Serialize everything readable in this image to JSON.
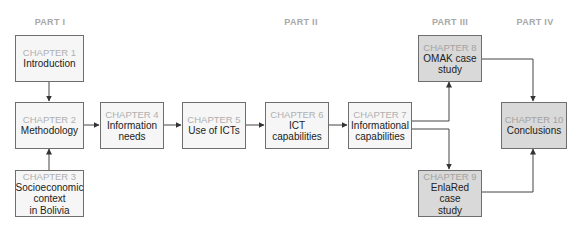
{
  "parts": [
    {
      "label": "PART I",
      "x": 50
    },
    {
      "label": "PART II",
      "x": 301
    },
    {
      "label": "PART III",
      "x": 450
    },
    {
      "label": "PART IV",
      "x": 535
    }
  ],
  "chapters": [
    {
      "id": "ch1",
      "chapter": "CHAPTER 1",
      "title_lines": [
        "Introduction"
      ],
      "part": "PART I",
      "shaded": false
    },
    {
      "id": "ch2",
      "chapter": "CHAPTER 2",
      "title_lines": [
        "Methodology"
      ],
      "part": "PART I",
      "shaded": false
    },
    {
      "id": "ch3",
      "chapter": "CHAPTER 3",
      "title_lines": [
        "Socioeconomic",
        "context",
        "in Bolivia"
      ],
      "part": "PART I",
      "shaded": false
    },
    {
      "id": "ch4",
      "chapter": "CHAPTER 4",
      "title_lines": [
        "Information",
        "needs"
      ],
      "part": "PART II",
      "shaded": false
    },
    {
      "id": "ch5",
      "chapter": "CHAPTER 5",
      "title_lines": [
        "Use of ICTs"
      ],
      "part": "PART II",
      "shaded": false
    },
    {
      "id": "ch6",
      "chapter": "CHAPTER 6",
      "title_lines": [
        "ICT",
        "capabilities"
      ],
      "part": "PART II",
      "shaded": false
    },
    {
      "id": "ch7",
      "chapter": "CHAPTER 7",
      "title_lines": [
        "Informational",
        "capabilities"
      ],
      "part": "PART II",
      "shaded": false
    },
    {
      "id": "ch8",
      "chapter": "CHAPTER 8",
      "title_lines": [
        "OMAK case",
        "study"
      ],
      "part": "PART III",
      "shaded": true
    },
    {
      "id": "ch9",
      "chapter": "CHAPTER 9",
      "title_lines": [
        "EnlaRed case",
        "study"
      ],
      "part": "PART III",
      "shaded": true
    },
    {
      "id": "ch10",
      "chapter": "CHAPTER 10",
      "title_lines": [
        "Conclusions"
      ],
      "part": "PART IV",
      "shaded": true
    }
  ],
  "arrows": [
    {
      "from": "ch1",
      "to": "ch2"
    },
    {
      "from": "ch3",
      "to": "ch2"
    },
    {
      "from": "ch2",
      "to": "ch4"
    },
    {
      "from": "ch4",
      "to": "ch5"
    },
    {
      "from": "ch5",
      "to": "ch6"
    },
    {
      "from": "ch6",
      "to": "ch7"
    },
    {
      "from": "ch7",
      "to": "ch8"
    },
    {
      "from": "ch7",
      "to": "ch9"
    },
    {
      "from": "ch8",
      "to": "ch10"
    },
    {
      "from": "ch9",
      "to": "ch10"
    }
  ],
  "colors": {
    "box_fill": "#f6f6f6",
    "box_fill_shaded": "#d9d9d9",
    "border": "#6e6e6e",
    "chapter_label": "#b0b0b0",
    "part_label": "#a8a8a8",
    "title_text": "#222222"
  }
}
